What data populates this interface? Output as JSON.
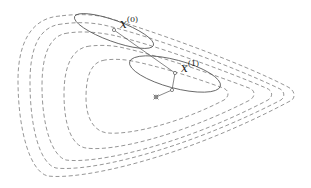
{
  "diagram": {
    "type": "optimization-contour-plot",
    "labels": {
      "x0": {
        "base": "x",
        "superscript": "(0)"
      },
      "x1": {
        "base": "x",
        "superscript": "(1)"
      }
    },
    "colors": {
      "contour": "#8a8a8a",
      "ellipse": "#555555",
      "path": "#555555",
      "text": "#222222"
    },
    "contour_count": 5,
    "iterates": [
      {
        "name": "x0",
        "x": 114,
        "y": 30
      },
      {
        "name": "x1",
        "x": 175,
        "y": 73
      },
      {
        "name": "step2",
        "x": 172,
        "y": 90
      },
      {
        "name": "optimum",
        "x": 156,
        "y": 97
      }
    ],
    "ellipses": [
      {
        "cx": 114,
        "cy": 31,
        "rx": 42,
        "ry": 11,
        "angle": 20
      },
      {
        "cx": 175,
        "cy": 74,
        "rx": 47,
        "ry": 14,
        "angle": 15
      }
    ]
  }
}
